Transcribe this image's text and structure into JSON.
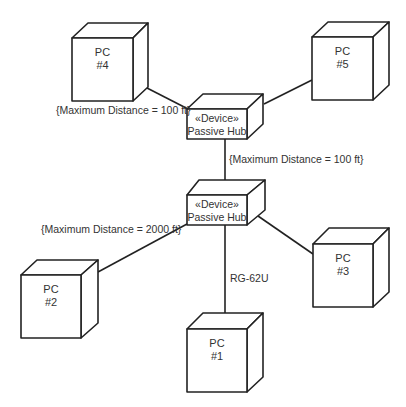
{
  "diagram": {
    "type": "UML deployment diagram",
    "nodes": [
      {
        "id": "pc4",
        "line1": "PC",
        "line2": "#4"
      },
      {
        "id": "pc5",
        "line1": "PC",
        "line2": "#5"
      },
      {
        "id": "hub_upper",
        "line1": "«Device»",
        "line2": "Passive Hub"
      },
      {
        "id": "hub_lower",
        "line1": "«Device»",
        "line2": "Passive Hub"
      },
      {
        "id": "pc2",
        "line1": "PC",
        "line2": "#2"
      },
      {
        "id": "pc3",
        "line1": "PC",
        "line2": "#3"
      },
      {
        "id": "pc1",
        "line1": "PC",
        "line2": "#1"
      }
    ],
    "edges": [
      {
        "from": "pc4",
        "to": "hub_upper",
        "label": "{Maximum Distance = 100 ft}"
      },
      {
        "from": "pc5",
        "to": "hub_upper",
        "label": ""
      },
      {
        "from": "hub_upper",
        "to": "hub_lower",
        "label": "{Maximum Distance = 100 ft}"
      },
      {
        "from": "pc2",
        "to": "hub_lower",
        "label": "{Maximum Distance = 2000 ft}"
      },
      {
        "from": "hub_lower",
        "to": "pc1",
        "label": "RG-62U"
      },
      {
        "from": "hub_lower",
        "to": "pc3",
        "label": ""
      }
    ]
  }
}
